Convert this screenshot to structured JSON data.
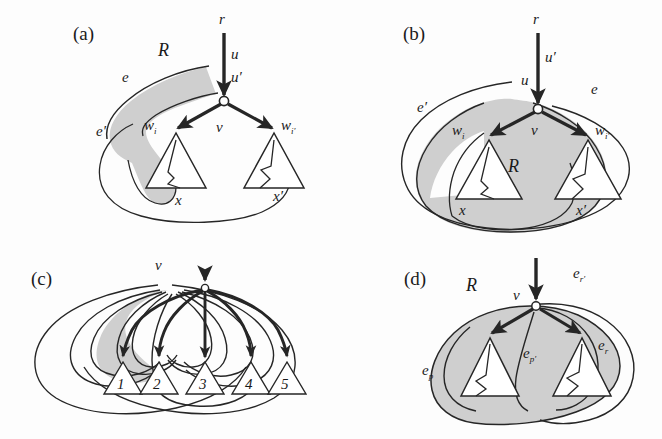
{
  "figure": {
    "background_color": "#fdfdfd",
    "ink_color": "#262626",
    "shade_color": "#cfcfcf",
    "node_fill": "#ffffff"
  },
  "panels": [
    {
      "id": "a",
      "caption": "(a)",
      "region_label": "R",
      "labels": {
        "root": "r",
        "u": "u",
        "u_prime": "u′",
        "v": "v",
        "e": "e",
        "e_prime": "e′",
        "w_i": "w",
        "w_i_sub": "i",
        "w_iprime": "w",
        "w_iprime_sub": "i′",
        "x": "x",
        "x_prime": "x′"
      }
    },
    {
      "id": "b",
      "caption": "(b)",
      "region_label": "R",
      "labels": {
        "root": "r",
        "u": "u",
        "u_prime": "u′",
        "v": "v",
        "e": "e",
        "e_prime": "e′",
        "w_i": "w",
        "w_i_sub": "i",
        "w_iprime": "w",
        "w_iprime_sub": "i′",
        "x": "x",
        "x_prime": "x′"
      }
    },
    {
      "id": "c",
      "caption": "(c)",
      "labels": {
        "v": "v"
      },
      "children": [
        "1",
        "2",
        "3",
        "4",
        "5"
      ]
    },
    {
      "id": "d",
      "caption": "(d)",
      "region_label": "R",
      "labels": {
        "v": "v",
        "e_p": "e",
        "e_p_sub": "p",
        "e_pprime": "e",
        "e_pprime_sub": "p′",
        "e_r": "e",
        "e_r_sub": "r",
        "e_rprime": "e",
        "e_rprime_sub": "r′"
      }
    }
  ]
}
